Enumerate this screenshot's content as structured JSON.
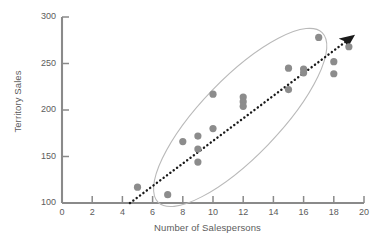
{
  "chart_data": {
    "type": "scatter",
    "title": "",
    "xlabel": "Number of Salespersons",
    "ylabel": "Territory Sales",
    "xlim": [
      0,
      20
    ],
    "ylim": [
      100,
      300
    ],
    "xticks": [
      0,
      2,
      4,
      6,
      8,
      10,
      12,
      14,
      16,
      18,
      20
    ],
    "yticks": [
      100,
      150,
      200,
      250,
      300
    ],
    "grid": false,
    "legend": null,
    "point_color": "#8c8c8c",
    "axis_color": "#8a8a8a",
    "trendline_color": "#1a1a1a",
    "ellipse_color": "#b9b9b9",
    "points": [
      {
        "x": 5,
        "y": 117
      },
      {
        "x": 7,
        "y": 109
      },
      {
        "x": 8,
        "y": 166
      },
      {
        "x": 9,
        "y": 172
      },
      {
        "x": 9,
        "y": 158
      },
      {
        "x": 9,
        "y": 144
      },
      {
        "x": 10,
        "y": 217
      },
      {
        "x": 10,
        "y": 180
      },
      {
        "x": 12,
        "y": 214
      },
      {
        "x": 12,
        "y": 209
      },
      {
        "x": 12,
        "y": 204
      },
      {
        "x": 15,
        "y": 245
      },
      {
        "x": 15,
        "y": 222
      },
      {
        "x": 16,
        "y": 244
      },
      {
        "x": 16,
        "y": 240
      },
      {
        "x": 17,
        "y": 278
      },
      {
        "x": 18,
        "y": 252
      },
      {
        "x": 18,
        "y": 239
      },
      {
        "x": 19,
        "y": 268
      }
    ],
    "trendline": {
      "style": "dotted-arrow",
      "from": {
        "x": 4.5,
        "y": 100
      },
      "to": {
        "x": 19.0,
        "y": 276
      }
    },
    "ellipse": {
      "center": {
        "x": 11.8,
        "y": 192
      },
      "rx": 118,
      "ry": 39,
      "rotation_deg": -46
    }
  }
}
